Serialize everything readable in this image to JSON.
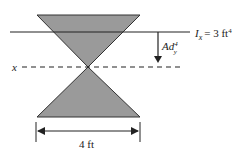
{
  "diagram": {
    "moment_label": {
      "symbol": "I",
      "subscript": "x",
      "equals": "= 3 ft",
      "superscript": "4"
    },
    "transfer_label": {
      "main": "Ad",
      "subscript": "y",
      "superscript": "4"
    },
    "axis_label": "x",
    "dimension_label": "4 ft",
    "colors": {
      "fill": "#9a9a9a",
      "stroke": "#333333"
    }
  }
}
